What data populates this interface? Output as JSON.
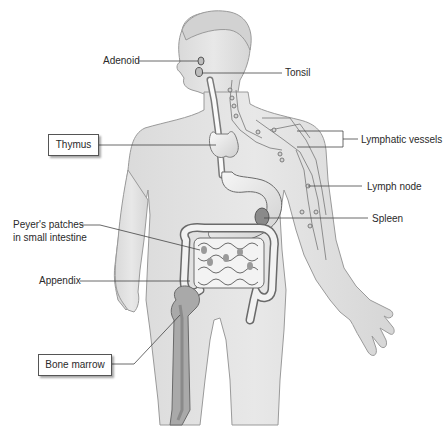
{
  "diagram": {
    "labels": {
      "adenoid": "Adenoid",
      "tonsil": "Tonsil",
      "thymus": "Thymus",
      "lymphatic_vessels": "Lymphatic vessels",
      "lymph_node": "Lymph node",
      "spleen": "Spleen",
      "peyers_line1": "Peyer's patches",
      "peyers_line2": "in small intestine",
      "appendix": "Appendix",
      "bone_marrow": "Bone marrow"
    },
    "colors": {
      "body_fill": "#e3e3e3",
      "body_outline": "#9a9a9a",
      "organ_fill": "#f4f4f4",
      "organ_dark": "#8a8a8a",
      "leader_line": "#444444"
    }
  }
}
